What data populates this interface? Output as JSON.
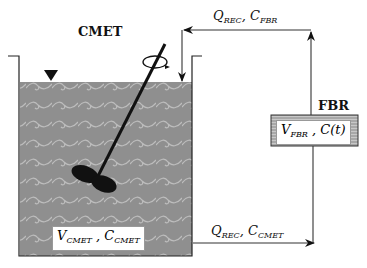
{
  "tank": {
    "title": "CMET",
    "volume_label": {
      "main": "V",
      "sub": "CMET",
      "sep": " , ",
      "main2": "C",
      "sub2": "CMET"
    },
    "liquid_color": "#8f8f8f",
    "wave_color": "#b9b9b9"
  },
  "reactor": {
    "title": "FBR",
    "label": {
      "main": "V",
      "sub": "FBR",
      "sep": " , ",
      "main2": "C(t)"
    },
    "fill_color": "#9a9a9a"
  },
  "flows": {
    "top": {
      "q": "Q",
      "q_sub": "REC",
      "sep": ", ",
      "c": "C",
      "c_sub": "FBR"
    },
    "bottom": {
      "q": "Q",
      "q_sub": "REC",
      "sep": ", ",
      "c": "C",
      "c_sub": "CMET"
    }
  },
  "icons": [
    "liquid-level-triangle-icon",
    "rotation-arrow-icon",
    "impeller-icon"
  ]
}
